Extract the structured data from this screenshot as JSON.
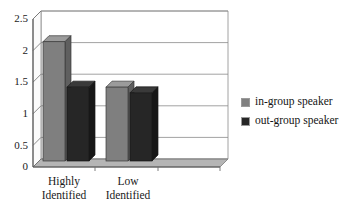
{
  "chart_data": {
    "type": "bar",
    "title": "",
    "subtitle": "",
    "xlabel": "",
    "ylabel": "",
    "categories": [
      "Highly Identified",
      "Low Identified"
    ],
    "category_lines": [
      [
        "Highly",
        "Identified"
      ],
      [
        "Low",
        "Identified"
      ]
    ],
    "series": [
      {
        "name": "in-group speaker",
        "values": [
          2.1,
          1.3
        ],
        "color": "#808080"
      },
      {
        "name": "out-group speaker",
        "values": [
          1.3,
          1.2
        ],
        "color": "#262626"
      }
    ],
    "ylim": [
      0,
      2.5
    ],
    "yticks": [
      0,
      0.5,
      1,
      1.5,
      2,
      2.5
    ],
    "ytick_labels": [
      "0",
      "0.5",
      "1",
      "1.5",
      "2",
      "2.5"
    ],
    "grid": true,
    "grid_axis": "y",
    "legend_position": "right",
    "style": "3d-bar",
    "background": "#ffffff",
    "axis_color": "#555555",
    "grid_color": "#888888"
  },
  "legend": {
    "entries": [
      {
        "label": "in-group speaker",
        "swatch": "#808080"
      },
      {
        "label": "out-group speaker",
        "swatch": "#262626"
      }
    ]
  },
  "axes": {
    "y_tick_labels": [
      "2.5",
      "2",
      "1.5",
      "1",
      "0.5",
      "0"
    ],
    "x_tick_labels": [
      "Highly Identified",
      "Low Identified"
    ]
  }
}
